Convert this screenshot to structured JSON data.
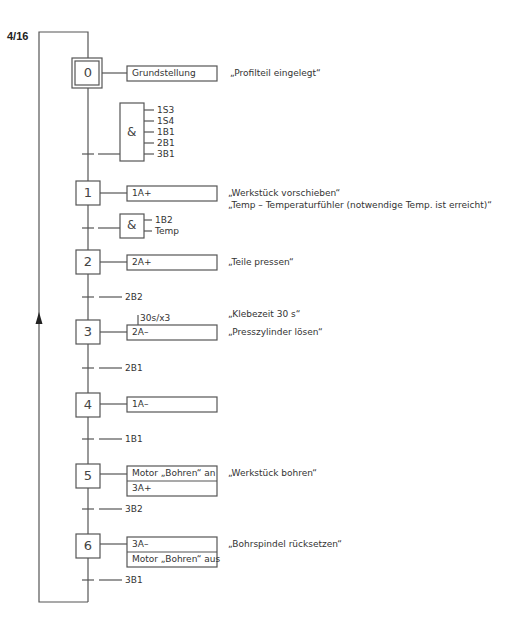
{
  "page_number": "4/16",
  "steps": [
    {
      "id": "0",
      "initial": true,
      "actions": [
        "Grundstellung"
      ],
      "comments": [
        "„Profilteil eingelegt“"
      ]
    },
    {
      "id": "1",
      "actions": [
        "1A+"
      ],
      "comments": [
        "„Werkstück vorschieben“",
        "„Temp – Temperaturfühler (notwendige Temp. ist erreicht)“"
      ]
    },
    {
      "id": "2",
      "actions": [
        "2A+"
      ],
      "comments": [
        "„Teile pressen“"
      ]
    },
    {
      "id": "3",
      "actions": [
        "2A–"
      ],
      "action_timer": "30s/x3",
      "comments": [
        "„Klebezeit 30 s“",
        "„Presszylinder lösen“"
      ]
    },
    {
      "id": "4",
      "actions": [
        "1A–"
      ],
      "comments": []
    },
    {
      "id": "5",
      "actions": [
        "Motor „Bohren“ an",
        "3A+"
      ],
      "comments": [
        "„Werkstück bohren“"
      ]
    },
    {
      "id": "6",
      "actions": [
        "3A–",
        "Motor „Bohren“ aus"
      ],
      "comments": [
        "„Bohrspindel rücksetzen“"
      ]
    }
  ],
  "transitions": [
    {
      "after_step": "0",
      "type": "AND",
      "symbol": "&",
      "inputs": [
        "1S3",
        "1S4",
        "1B1",
        "2B1",
        "3B1"
      ]
    },
    {
      "after_step": "1",
      "type": "AND",
      "symbol": "&",
      "inputs": [
        "1B2",
        "Temp"
      ]
    },
    {
      "after_step": "2",
      "condition": "2B2"
    },
    {
      "after_step": "3",
      "condition": "2B1"
    },
    {
      "after_step": "4",
      "condition": "1B1"
    },
    {
      "after_step": "5",
      "condition": "3B2"
    },
    {
      "after_step": "6",
      "condition": "3B1"
    }
  ]
}
